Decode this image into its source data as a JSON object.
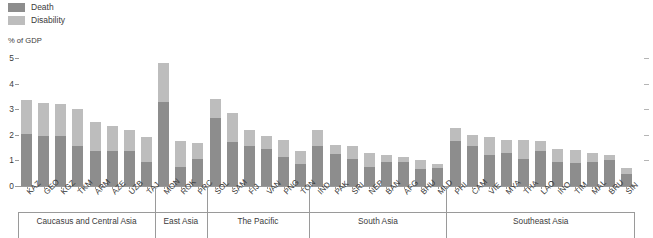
{
  "legend": {
    "items": [
      {
        "label": "Death",
        "color": "#8d8d8d",
        "icon": "legend-swatch-icon"
      },
      {
        "label": "Disability",
        "color": "#bdbdbd",
        "icon": "legend-swatch-icon"
      }
    ]
  },
  "axis": {
    "unit_caption": "% of GDP"
  },
  "chart_data": {
    "type": "bar",
    "subtype": "stacked",
    "title": "",
    "subtitle": "",
    "xlabel": "",
    "ylabel": "% of GDP",
    "ylim": [
      0,
      5
    ],
    "yticks": [
      0,
      1,
      2,
      3,
      4,
      5
    ],
    "ytick_labels": [
      "0",
      "1",
      "2",
      "3",
      "4",
      "5"
    ],
    "grid": false,
    "legend_position": "top-left",
    "colors": {
      "death": "#8d8d8d",
      "disability": "#bdbdbd"
    },
    "categories": [
      "KAZ",
      "GEO",
      "KGZ",
      "TKM",
      "ARM",
      "AZE",
      "UZB",
      "TAJ",
      "MON",
      "ROK",
      "PRC",
      "SOL",
      "SAM",
      "FIJ",
      "VAN",
      "PNG",
      "TON",
      "IND",
      "PAK",
      "SRI",
      "NEP",
      "BAN",
      "AFG",
      "BHU",
      "MLD",
      "PHI",
      "CAM",
      "VIE",
      "MYA",
      "THA",
      "LAO",
      "INO",
      "TIM",
      "MAL",
      "BRU",
      "SIN"
    ],
    "series": [
      {
        "name": "Death",
        "values": [
          2.05,
          1.95,
          1.95,
          1.55,
          1.35,
          1.35,
          1.35,
          0.95,
          3.3,
          0.75,
          1.05,
          2.65,
          1.7,
          1.55,
          1.45,
          1.15,
          0.85,
          1.55,
          1.25,
          1.05,
          0.75,
          0.95,
          0.95,
          0.65,
          0.7,
          1.75,
          1.55,
          1.2,
          1.3,
          1.05,
          1.35,
          0.95,
          0.9,
          0.95,
          1.0,
          0.45
        ]
      },
      {
        "name": "Disability",
        "values": [
          1.3,
          1.3,
          1.25,
          1.45,
          1.15,
          1.0,
          0.85,
          0.95,
          1.5,
          1.0,
          0.65,
          0.75,
          1.15,
          0.65,
          0.5,
          0.65,
          0.5,
          0.65,
          0.35,
          0.5,
          0.55,
          0.25,
          0.2,
          0.35,
          0.15,
          0.5,
          0.45,
          0.7,
          0.5,
          0.75,
          0.4,
          0.5,
          0.5,
          0.35,
          0.2,
          0.25
        ]
      }
    ],
    "totals": [
      3.35,
      3.25,
      3.2,
      3.0,
      2.5,
      2.35,
      2.2,
      1.9,
      4.8,
      1.75,
      1.7,
      3.4,
      2.85,
      2.2,
      1.95,
      1.8,
      1.35,
      2.2,
      1.6,
      1.55,
      1.3,
      1.2,
      1.15,
      1.0,
      0.85,
      2.25,
      2.0,
      1.9,
      1.8,
      1.8,
      1.75,
      1.45,
      1.4,
      1.3,
      1.2,
      0.7
    ],
    "groups": [
      {
        "label": "Caucasus and Central Asia",
        "start": 0,
        "count": 8
      },
      {
        "label": "East Asia",
        "start": 8,
        "count": 3
      },
      {
        "label": "The Pacific",
        "start": 11,
        "count": 6
      },
      {
        "label": "South Asia",
        "start": 17,
        "count": 8
      },
      {
        "label": "Southeast Asia",
        "start": 25,
        "count": 11
      }
    ]
  }
}
